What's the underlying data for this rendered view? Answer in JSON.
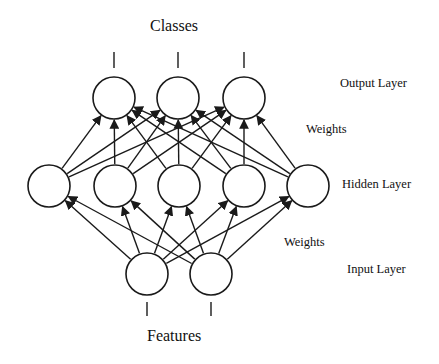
{
  "diagram": {
    "type": "neural-network",
    "top_label": "Classes",
    "bottom_label": "Features",
    "side_labels": {
      "output_layer": "Output Layer",
      "weights_upper": "Weights",
      "hidden_layer": "Hidden Layer",
      "weights_lower": "Weights",
      "input_layer": "Input Layer"
    },
    "layers": [
      {
        "name": "Output Layer",
        "nodes": 3
      },
      {
        "name": "Hidden Layer",
        "nodes": 5
      },
      {
        "name": "Input Layer",
        "nodes": 2
      }
    ],
    "connections": "fully-connected, arrows pointing upward",
    "colors": {
      "stroke": "#1a1a1a",
      "background": "#ffffff"
    }
  }
}
